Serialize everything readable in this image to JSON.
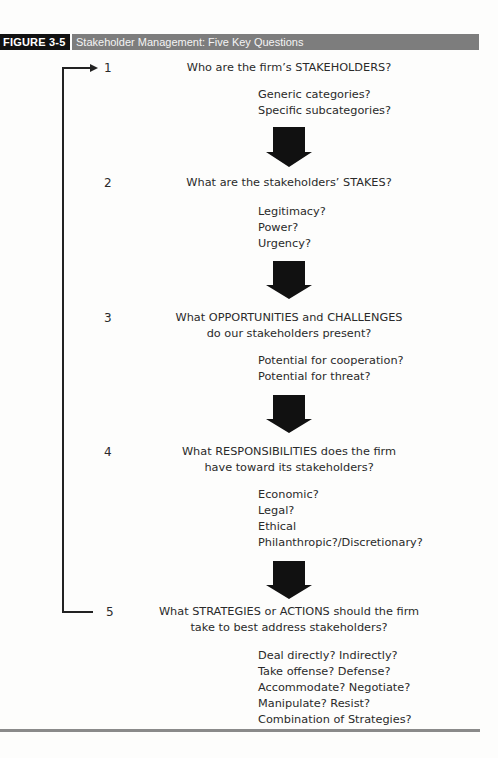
{
  "figure": {
    "label": "FIGURE 3-5",
    "title": "Stakeholder Management: Five Key Questions"
  },
  "colors": {
    "label_bg": "#111111",
    "title_bar_bg": "#7d7d7d",
    "arrow": "#111111",
    "rule": "#8a8a8a"
  },
  "steps": [
    {
      "number": "1",
      "question_lines": [
        "Who are the firm’s STAKEHOLDERS?"
      ],
      "subquestions": [
        "Generic categories?",
        "Specific subcategories?"
      ]
    },
    {
      "number": "2",
      "question_lines": [
        "What are the stakeholders’ STAKES?"
      ],
      "subquestions": [
        "Legitimacy?",
        "Power?",
        "Urgency?"
      ]
    },
    {
      "number": "3",
      "question_lines": [
        "What OPPORTUNITIES and CHALLENGES",
        "do our stakeholders present?"
      ],
      "subquestions": [
        "Potential for cooperation?",
        "Potential for threat?"
      ]
    },
    {
      "number": "4",
      "question_lines": [
        "What RESPONSIBILITIES does the firm",
        "have toward its stakeholders?"
      ],
      "subquestions": [
        "Economic?",
        "Legal?",
        "Ethical",
        "Philanthropic?/Discretionary?"
      ]
    },
    {
      "number": "5",
      "question_lines": [
        "What STRATEGIES or ACTIONS should the firm",
        "take to best address stakeholders?"
      ],
      "subquestions": [
        "Deal directly? Indirectly?",
        "Take offense? Defense?",
        "Accommodate? Negotiate?",
        "Manipulate? Resist?",
        "Combination of Strategies?"
      ]
    }
  ],
  "connectors": {
    "flow_arrows": [
      "down-arrow-1-to-2",
      "down-arrow-2-to-3",
      "down-arrow-3-to-4",
      "down-arrow-4-to-5"
    ],
    "feedback_loop": "arrow from step 5 back to step 1"
  }
}
